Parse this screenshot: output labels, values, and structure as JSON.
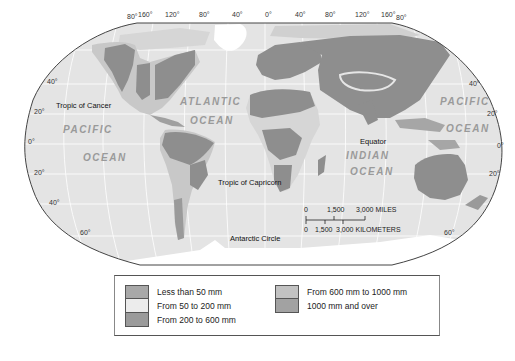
{
  "map": {
    "title": "World Precipitation",
    "longitude_labels": [
      "80°",
      "160°",
      "120°",
      "80°",
      "40°",
      "0°",
      "40°",
      "80°",
      "120°",
      "160°",
      "80°"
    ],
    "latitude_labels_left": [
      "40°",
      "20°",
      "0°",
      "20°",
      "40°",
      "60°"
    ],
    "latitude_labels_right": [
      "40°",
      "20°",
      "0°",
      "20°",
      "60°"
    ],
    "reference_lines": {
      "tropic_of_cancer": "Tropic of Cancer",
      "tropic_of_capricorn": "Tropic of Capricorn",
      "equator": "Equator",
      "antarctic_circle": "Antarctic Circle"
    },
    "oceans": {
      "pacific_west_1": "PACIFIC",
      "pacific_west_2": "OCEAN",
      "atlantic_1": "ATLANTIC",
      "atlantic_2": "OCEAN",
      "indian_1": "INDIAN",
      "indian_2": "OCEAN",
      "pacific_east_1": "PACIFIC",
      "pacific_east_2": "OCEAN"
    },
    "scale": {
      "miles_0": "0",
      "miles_1": "1,500",
      "miles_2": "3,000 MILES",
      "km_0": "0",
      "km_1": "1,500",
      "km_2": "3,000 KILOMETERS"
    },
    "colors": {
      "ocean": "#e4e4e4",
      "graticule": "#ffffff",
      "less_than_50": "#a9a9a9",
      "50_to_200": "#e8e8e8",
      "200_to_600": "#9a9a9a",
      "600_to_1000": "#c4c4c4",
      "over_1000": "#8e8e8e",
      "ice": "#ffffff",
      "border": "#444444"
    }
  },
  "legend": {
    "items": [
      {
        "label": "Less than 50 mm",
        "color": "#a8a8a8"
      },
      {
        "label": "From 50 to 200 mm",
        "color": "#ececec"
      },
      {
        "label": "From 200 to 600 mm",
        "color": "#9b9b9b"
      },
      {
        "label": "From 600 mm to 1000 mm",
        "color": "#c2c2c2"
      },
      {
        "label": "1000 mm and over",
        "color": "#a2a2a2"
      }
    ]
  }
}
